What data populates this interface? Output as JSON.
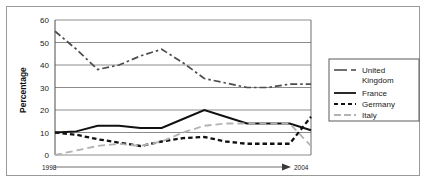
{
  "chart_data": {
    "type": "line",
    "title": "",
    "xlabel": "",
    "ylabel": "Percentage",
    "ylim": [
      0,
      60
    ],
    "yticks": [
      0,
      10,
      20,
      30,
      40,
      50,
      60
    ],
    "ytick_labels": [
      "0",
      "10",
      "20",
      "30",
      "40",
      "50",
      "60"
    ],
    "grid": true,
    "x_axis_start_label": "1998",
    "x_axis_end_label": "2004",
    "x_axis_arrow": true,
    "legend_position": "right",
    "x": [
      1998,
      1998.5,
      1999,
      1999.5,
      2000,
      2000.5,
      2001,
      2001.5,
      2002,
      2002.5,
      2003,
      2003.5,
      2004
    ],
    "series": [
      {
        "name": "United Kingdom",
        "style": "dash-dot",
        "color": "#4d4d4d",
        "values": [
          55,
          47,
          38,
          40,
          44,
          47,
          41,
          34,
          32,
          30,
          30,
          31.5,
          31.5
        ]
      },
      {
        "name": "France",
        "style": "solid",
        "color": "#111111",
        "values": [
          10,
          10.5,
          13,
          13,
          12,
          12,
          16,
          20,
          17,
          14,
          14,
          14,
          11
        ]
      },
      {
        "name": "Germany",
        "style": "dashed",
        "color": "#111111",
        "values": [
          10,
          9,
          7,
          5.5,
          4,
          6,
          7.5,
          8,
          6,
          5,
          5,
          5,
          17
        ]
      },
      {
        "name": "Italy",
        "style": "long-dash",
        "color": "#b3b3b3",
        "values": [
          0,
          2,
          4,
          5,
          4,
          6,
          10,
          13,
          14,
          14,
          14,
          14,
          4
        ]
      }
    ]
  },
  "axis": {
    "y_title": "Percentage",
    "y_labels": [
      "60",
      "50",
      "40",
      "30",
      "20",
      "10",
      "0"
    ],
    "x_start": "1998",
    "x_end": "2004"
  },
  "legend": {
    "entries": [
      {
        "label_line1": "United",
        "label_line2": "Kingdom",
        "swatch": "dash-dot-swatch"
      },
      {
        "label_line1": "France",
        "label_line2": "",
        "swatch": "solid-swatch"
      },
      {
        "label_line1": "Germany",
        "label_line2": "",
        "swatch": "dashed-swatch"
      },
      {
        "label_line1": "Italy",
        "label_line2": "",
        "swatch": "long-dash-swatch"
      }
    ]
  }
}
